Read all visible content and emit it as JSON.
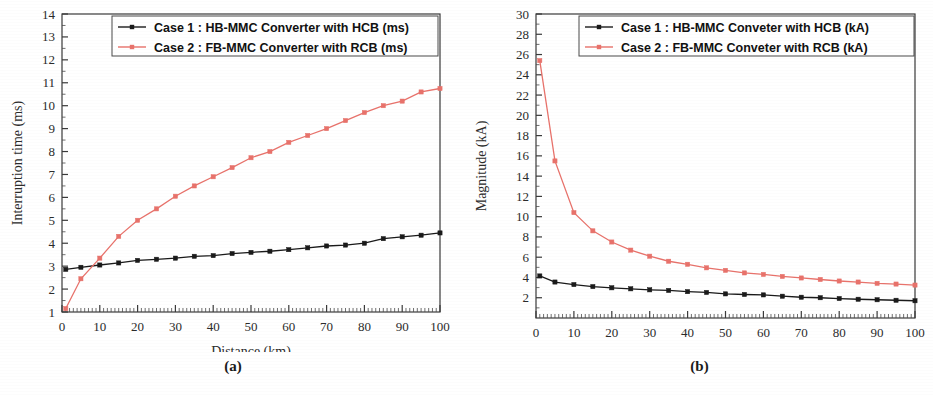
{
  "figure": {
    "panels": [
      {
        "caption": "(a)",
        "chart_data": {
          "type": "line",
          "title": "",
          "xlabel": "Distance (km)",
          "ylabel": "Interruption time (ms)",
          "xlim": [
            0,
            100
          ],
          "ylim": [
            1,
            14
          ],
          "xticks": [
            0,
            10,
            20,
            30,
            40,
            50,
            60,
            70,
            80,
            90,
            100
          ],
          "yticks": [
            1,
            2,
            3,
            4,
            5,
            6,
            7,
            8,
            9,
            10,
            11,
            12,
            13,
            14
          ],
          "grid": false,
          "legend_position": "top-center",
          "x": [
            1,
            5,
            10,
            15,
            20,
            25,
            30,
            35,
            40,
            45,
            50,
            55,
            60,
            65,
            70,
            75,
            80,
            85,
            90,
            95,
            100
          ],
          "series": [
            {
              "name": "Case 1 : HB-MMC Converter with HCB (ms)",
              "color": "#1a1a1a",
              "marker": "square",
              "values": [
                2.86,
                2.95,
                3.05,
                3.14,
                3.25,
                3.3,
                3.35,
                3.43,
                3.46,
                3.55,
                3.6,
                3.65,
                3.72,
                3.8,
                3.88,
                3.92,
                4.0,
                4.2,
                4.28,
                4.35,
                4.45
              ]
            },
            {
              "name": "Case 2 : FB-MMC Converter with RCB (ms)",
              "color": "#e8726b",
              "marker": "square",
              "values": [
                1.15,
                2.45,
                3.35,
                4.3,
                5.0,
                5.5,
                6.05,
                6.5,
                6.9,
                7.3,
                7.73,
                8.0,
                8.4,
                8.7,
                9.0,
                9.35,
                9.7,
                10.0,
                10.2,
                10.6,
                10.75
              ]
            }
          ]
        }
      },
      {
        "caption": "(b)",
        "chart_data": {
          "type": "line",
          "title": "",
          "xlabel": "Distance (km)",
          "ylabel": "Magnitude (kA)",
          "xlim": [
            0,
            100
          ],
          "ylim": [
            0,
            30
          ],
          "xticks": [
            0,
            10,
            20,
            30,
            40,
            50,
            60,
            70,
            80,
            90,
            100
          ],
          "yticks": [
            2,
            4,
            6,
            8,
            10,
            12,
            14,
            16,
            18,
            20,
            22,
            24,
            26,
            28,
            30
          ],
          "grid": false,
          "legend_position": "top-center",
          "x": [
            1,
            5,
            10,
            15,
            20,
            25,
            30,
            35,
            40,
            45,
            50,
            55,
            60,
            65,
            70,
            75,
            80,
            85,
            90,
            95,
            100
          ],
          "series": [
            {
              "name": "Case 1 : HB-MMC Conveter with HCB  (kA)",
              "color": "#1a1a1a",
              "marker": "square",
              "values": [
                4.15,
                3.55,
                3.3,
                3.1,
                2.98,
                2.88,
                2.78,
                2.72,
                2.6,
                2.52,
                2.38,
                2.32,
                2.28,
                2.15,
                2.05,
                2.0,
                1.92,
                1.85,
                1.8,
                1.75,
                1.7
              ]
            },
            {
              "name": "Case 2 : FB-MMC Conveter with RCB  (kA)",
              "color": "#e8726b",
              "marker": "square",
              "values": [
                25.4,
                15.5,
                10.4,
                8.6,
                7.5,
                6.7,
                6.1,
                5.6,
                5.3,
                4.95,
                4.7,
                4.45,
                4.3,
                4.1,
                3.95,
                3.8,
                3.65,
                3.55,
                3.42,
                3.35,
                3.25
              ]
            }
          ]
        }
      }
    ]
  }
}
